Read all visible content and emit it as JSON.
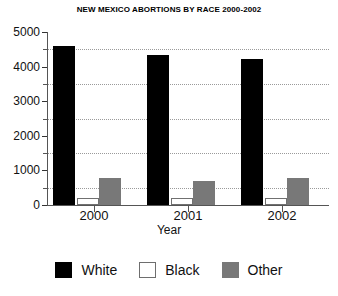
{
  "chart_data": {
    "type": "bar",
    "title": "NEW MEXICO ABORTIONS BY RACE 2000-2002",
    "xlabel": "Year",
    "ylabel": "",
    "categories": [
      "2000",
      "2001",
      "2002"
    ],
    "series": [
      {
        "name": "White",
        "color": "#000000",
        "values": [
          4610,
          4350,
          4230
        ]
      },
      {
        "name": "Black",
        "color": "#ffffff",
        "values": [
          200,
          190,
          200
        ]
      },
      {
        "name": "Other",
        "color": "#787878",
        "values": [
          770,
          700,
          780
        ]
      }
    ],
    "ylim": [
      0,
      5000
    ],
    "ytick_labels": [
      "0",
      "1000",
      "2000",
      "3000",
      "4000",
      "5000"
    ],
    "ytick_values": [
      0,
      1000,
      2000,
      3000,
      4000,
      5000
    ],
    "minor_tick_step": 500,
    "grid": "horizontal-dotted",
    "legend_position": "bottom"
  },
  "legend": {
    "items": [
      {
        "label": "White",
        "swatch": "swatch-black-fill"
      },
      {
        "label": "Black",
        "swatch": "swatch-white-fill"
      },
      {
        "label": "Other",
        "swatch": "swatch-gray-fill"
      }
    ]
  }
}
